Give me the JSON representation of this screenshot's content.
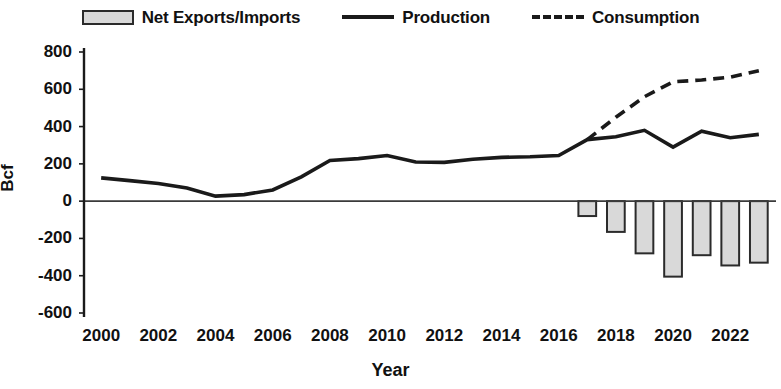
{
  "chart_data": {
    "type": "bar",
    "title": "",
    "xlabel": "Year",
    "ylabel": "Bcf",
    "x": [
      2000,
      2001,
      2002,
      2003,
      2004,
      2005,
      2006,
      2007,
      2008,
      2009,
      2010,
      2011,
      2012,
      2013,
      2014,
      2015,
      2016,
      2017,
      2018,
      2019,
      2020,
      2021,
      2022,
      2023
    ],
    "categories": [
      "2000",
      "2001",
      "2002",
      "2003",
      "2004",
      "2005",
      "2006",
      "2007",
      "2008",
      "2009",
      "2010",
      "2011",
      "2012",
      "2013",
      "2014",
      "2015",
      "2016",
      "2017",
      "2018",
      "2019",
      "2020",
      "2021",
      "2022",
      "2023"
    ],
    "xtick_labels": [
      "2000",
      "2002",
      "2004",
      "2006",
      "2008",
      "2010",
      "2012",
      "2014",
      "2016",
      "2018",
      "2020",
      "2022"
    ],
    "xtick_values": [
      2000,
      2002,
      2004,
      2006,
      2008,
      2010,
      2012,
      2014,
      2016,
      2018,
      2020,
      2022
    ],
    "ytick_labels": [
      "800",
      "600",
      "400",
      "200",
      "0",
      "-200",
      "-400",
      "-600"
    ],
    "ytick_values": [
      800,
      600,
      400,
      200,
      0,
      -200,
      -400,
      -600
    ],
    "ylim": [
      -600,
      800
    ],
    "xlim": [
      1999.4,
      2023.6
    ],
    "grid": false,
    "legend_position": "top",
    "series": [
      {
        "name": "Net Exports/Imports",
        "type": "bar",
        "color": "#d9d9d9",
        "edge_color": "#2b2b2b",
        "values": [
          0,
          0,
          0,
          0,
          0,
          0,
          0,
          0,
          0,
          0,
          0,
          0,
          0,
          0,
          0,
          0,
          0,
          -80,
          -165,
          -280,
          -405,
          -290,
          -345,
          -330
        ]
      },
      {
        "name": "Production",
        "type": "line",
        "style": "solid",
        "color": "#1a1a1a",
        "values": [
          125,
          110,
          95,
          70,
          27,
          35,
          60,
          130,
          218,
          228,
          245,
          210,
          208,
          225,
          235,
          238,
          245,
          330,
          345,
          380,
          290,
          375,
          340,
          358
        ]
      },
      {
        "name": "Consumption",
        "type": "line",
        "style": "dashed",
        "color": "#1a1a1a",
        "values": [
          null,
          null,
          null,
          null,
          null,
          null,
          null,
          null,
          null,
          null,
          null,
          null,
          null,
          null,
          null,
          null,
          null,
          330,
          450,
          560,
          640,
          650,
          665,
          700
        ]
      }
    ]
  },
  "legend": {
    "items": [
      {
        "label": "Net Exports/Imports",
        "marker": "bar-swatch"
      },
      {
        "label": "Production",
        "marker": "solid-line-swatch"
      },
      {
        "label": "Consumption",
        "marker": "dashed-line-swatch"
      }
    ]
  },
  "axes": {
    "y_title": "Bcf",
    "x_title": "Year"
  }
}
